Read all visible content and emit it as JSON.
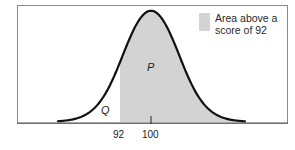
{
  "chart_data": {
    "type": "area",
    "title": "",
    "distribution": {
      "mean": 100,
      "sd_px": 29
    },
    "x_ticks": [
      {
        "value": 92,
        "label": "92"
      },
      {
        "value": 100,
        "label": "100"
      }
    ],
    "shaded_region": {
      "from": 92,
      "to": "upper tail",
      "label": "P",
      "color": "#d3d3d3"
    },
    "unshaded_region": {
      "to": 92,
      "label": "Q"
    },
    "legend": [
      {
        "label": "Area above a score of 92",
        "color": "#d3d3d3"
      }
    ],
    "xlabel": "",
    "ylabel": ""
  },
  "labels": {
    "p": "P",
    "q": "Q",
    "tick_92": "92",
    "tick_100": "100",
    "legend_line1": "Area above a",
    "legend_line2": "score of 92"
  },
  "colors": {
    "shade": "#d3d3d3",
    "curve": "#111111",
    "frame": "#777777"
  }
}
